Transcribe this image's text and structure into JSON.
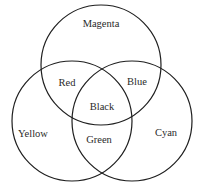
{
  "diagram": {
    "type": "venn",
    "stroke_color": "#1e1e1e",
    "circles": [
      {
        "id": "magenta",
        "cx": 101,
        "cy": 65,
        "r": 60
      },
      {
        "id": "yellow",
        "cx": 72,
        "cy": 121,
        "r": 60
      },
      {
        "id": "cyan",
        "cx": 132,
        "cy": 121,
        "r": 60
      }
    ],
    "labels": {
      "magenta": {
        "text": "Magenta",
        "x": 101,
        "y": 25
      },
      "red": {
        "text": "Red",
        "x": 67,
        "y": 84
      },
      "blue": {
        "text": "Blue",
        "x": 137,
        "y": 83
      },
      "black": {
        "text": "Black",
        "x": 102,
        "y": 108
      },
      "yellow": {
        "text": "Yellow",
        "x": 33,
        "y": 135
      },
      "green": {
        "text": "Green",
        "x": 99,
        "y": 141
      },
      "cyan": {
        "text": "Cyan",
        "x": 166,
        "y": 134
      }
    }
  }
}
